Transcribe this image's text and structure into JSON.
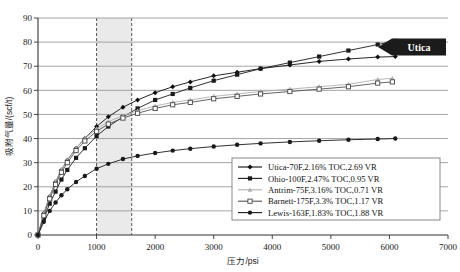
{
  "chart_data": {
    "type": "line",
    "title": "",
    "xlabel": "压力/psi",
    "ylabel": "吸附气量/(scf/t)",
    "xlim": [
      0,
      7000
    ],
    "ylim": [
      0,
      90
    ],
    "xticks": [
      0,
      1000,
      2000,
      3000,
      4000,
      5000,
      6000,
      7000
    ],
    "yticks": [
      0,
      10,
      20,
      30,
      40,
      50,
      60,
      70,
      80,
      90
    ],
    "grid": "horizontal",
    "legend_position": "lower-right",
    "annotations": [
      {
        "name": "utica-arrow-callout",
        "label": "Utica",
        "shape": "left-arrow-banner",
        "color": "#1b1b1b"
      },
      {
        "name": "shaded-band",
        "label": "",
        "x_start": 1000,
        "x_end": 1600,
        "color": "#d9d9d9",
        "border": "dashed"
      }
    ],
    "series": [
      {
        "name": "Utica-70F,2.16% TOC,2.69 VR",
        "marker": "filled-diamond",
        "color": "#111111",
        "x": [
          0,
          100,
          200,
          300,
          400,
          500,
          650,
          800,
          1000,
          1200,
          1450,
          1700,
          2000,
          2300,
          2600,
          3000,
          3400,
          3800,
          4300,
          4800,
          5300,
          5800,
          6100
        ],
        "y": [
          0,
          9,
          16,
          22,
          27,
          31,
          36,
          40,
          45,
          49,
          53,
          56,
          59,
          61.5,
          63.5,
          66,
          67.5,
          69,
          70.5,
          72,
          73,
          73.8,
          74
        ]
      },
      {
        "name": "Ohio-100F,2.47% TOC,0.95 VR",
        "marker": "filled-square",
        "color": "#1a1a1a",
        "x": [
          0,
          100,
          200,
          300,
          400,
          500,
          650,
          800,
          1000,
          1200,
          1450,
          1700,
          2000,
          2300,
          2600,
          3000,
          3400,
          3800,
          4300,
          4800,
          5300,
          5800,
          6100
        ],
        "y": [
          0,
          7,
          13,
          18,
          23,
          27,
          32,
          36,
          41,
          45,
          49,
          52.5,
          56,
          58.5,
          61,
          64,
          66.5,
          69,
          71.5,
          74,
          76.5,
          79,
          80.5
        ]
      },
      {
        "name": "Antrim-75F,3.16% TOC,0.71 VR",
        "marker": "light-triangle",
        "color": "#b0b0b0",
        "x": [
          0,
          100,
          200,
          300,
          400,
          500,
          650,
          800,
          1000,
          1200,
          1450,
          1700,
          2000,
          2300,
          2600,
          3000,
          3400,
          3800,
          4300,
          4800,
          5300,
          5800,
          6050
        ],
        "y": [
          0,
          9,
          16,
          22,
          27,
          31,
          36,
          40,
          44,
          47,
          49.5,
          51.5,
          53.5,
          55,
          56,
          57.5,
          58.5,
          59.5,
          60.5,
          61.5,
          62.5,
          64.5,
          65
        ]
      },
      {
        "name": "Barnett-175F,3.3% TOC,1.17 VR",
        "marker": "open-square",
        "color": "#555555",
        "x": [
          0,
          100,
          200,
          300,
          400,
          500,
          650,
          800,
          1000,
          1200,
          1450,
          1700,
          2000,
          2300,
          2600,
          3000,
          3400,
          3800,
          4300,
          4800,
          5300,
          5800,
          6050
        ],
        "y": [
          0,
          8,
          15,
          21,
          26,
          30,
          35,
          39,
          43,
          46,
          48.5,
          50.5,
          52.5,
          54,
          55,
          56.5,
          57.5,
          58.5,
          59.5,
          60.5,
          61.5,
          63,
          63.5
        ]
      },
      {
        "name": "Lewis-163F,1.83% TOC,1.88 VR",
        "marker": "filled-circle",
        "color": "#1a1a1a",
        "x": [
          0,
          100,
          200,
          300,
          400,
          500,
          650,
          800,
          1000,
          1200,
          1450,
          1700,
          2000,
          2300,
          2600,
          3000,
          3400,
          3800,
          4300,
          4800,
          5300,
          5800,
          6100
        ],
        "y": [
          0,
          5.5,
          10,
          13.5,
          16.5,
          19,
          22,
          24.5,
          27.5,
          29.5,
          31.5,
          32.8,
          34,
          35,
          35.8,
          36.7,
          37.4,
          38,
          38.6,
          39.1,
          39.5,
          39.8,
          40
        ]
      }
    ]
  }
}
